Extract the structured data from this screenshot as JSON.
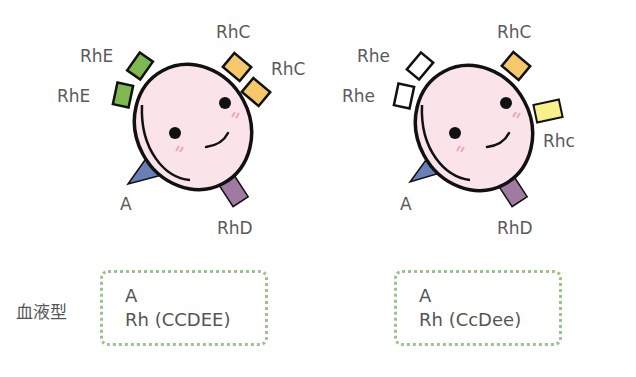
{
  "cells": [
    {
      "name": "left",
      "antigens": {
        "top_right_1": {
          "label": "RhC",
          "color": "#f7c86a"
        },
        "top_right_2": {
          "label": "RhC",
          "color": "#f7c86a"
        },
        "top_left_1": {
          "label": "RhE",
          "color": "#7fb850"
        },
        "top_left_2": {
          "label": "RhE",
          "color": "#7fb850"
        },
        "bottom_left": {
          "label": "A",
          "color": "#6a7fb8"
        },
        "bottom_right": {
          "label": "RhD",
          "color": "#a07aa0"
        }
      },
      "blood_type": {
        "abo": "A",
        "rh": "Rh (CCDEE)"
      }
    },
    {
      "name": "right",
      "antigens": {
        "top_right_1": {
          "label": "RhC",
          "color": "#f7c86a"
        },
        "right": {
          "label": "Rhc",
          "color": "#f8f08a"
        },
        "top_left_1": {
          "label": "Rhe",
          "color": "#ffffff"
        },
        "top_left_2": {
          "label": "Rhe",
          "color": "#ffffff"
        },
        "bottom_left": {
          "label": "A",
          "color": "#6a7fb8"
        },
        "bottom_right": {
          "label": "RhD",
          "color": "#a07aa0"
        }
      },
      "blood_type": {
        "abo": "A",
        "rh": "Rh (CcDee)"
      }
    }
  ],
  "blood_type_label": "血液型",
  "colors": {
    "cell_fill": "#fbe3ea",
    "outline": "#111111",
    "cheek": "#f0a0b8",
    "box_border": "#9cc48a"
  }
}
